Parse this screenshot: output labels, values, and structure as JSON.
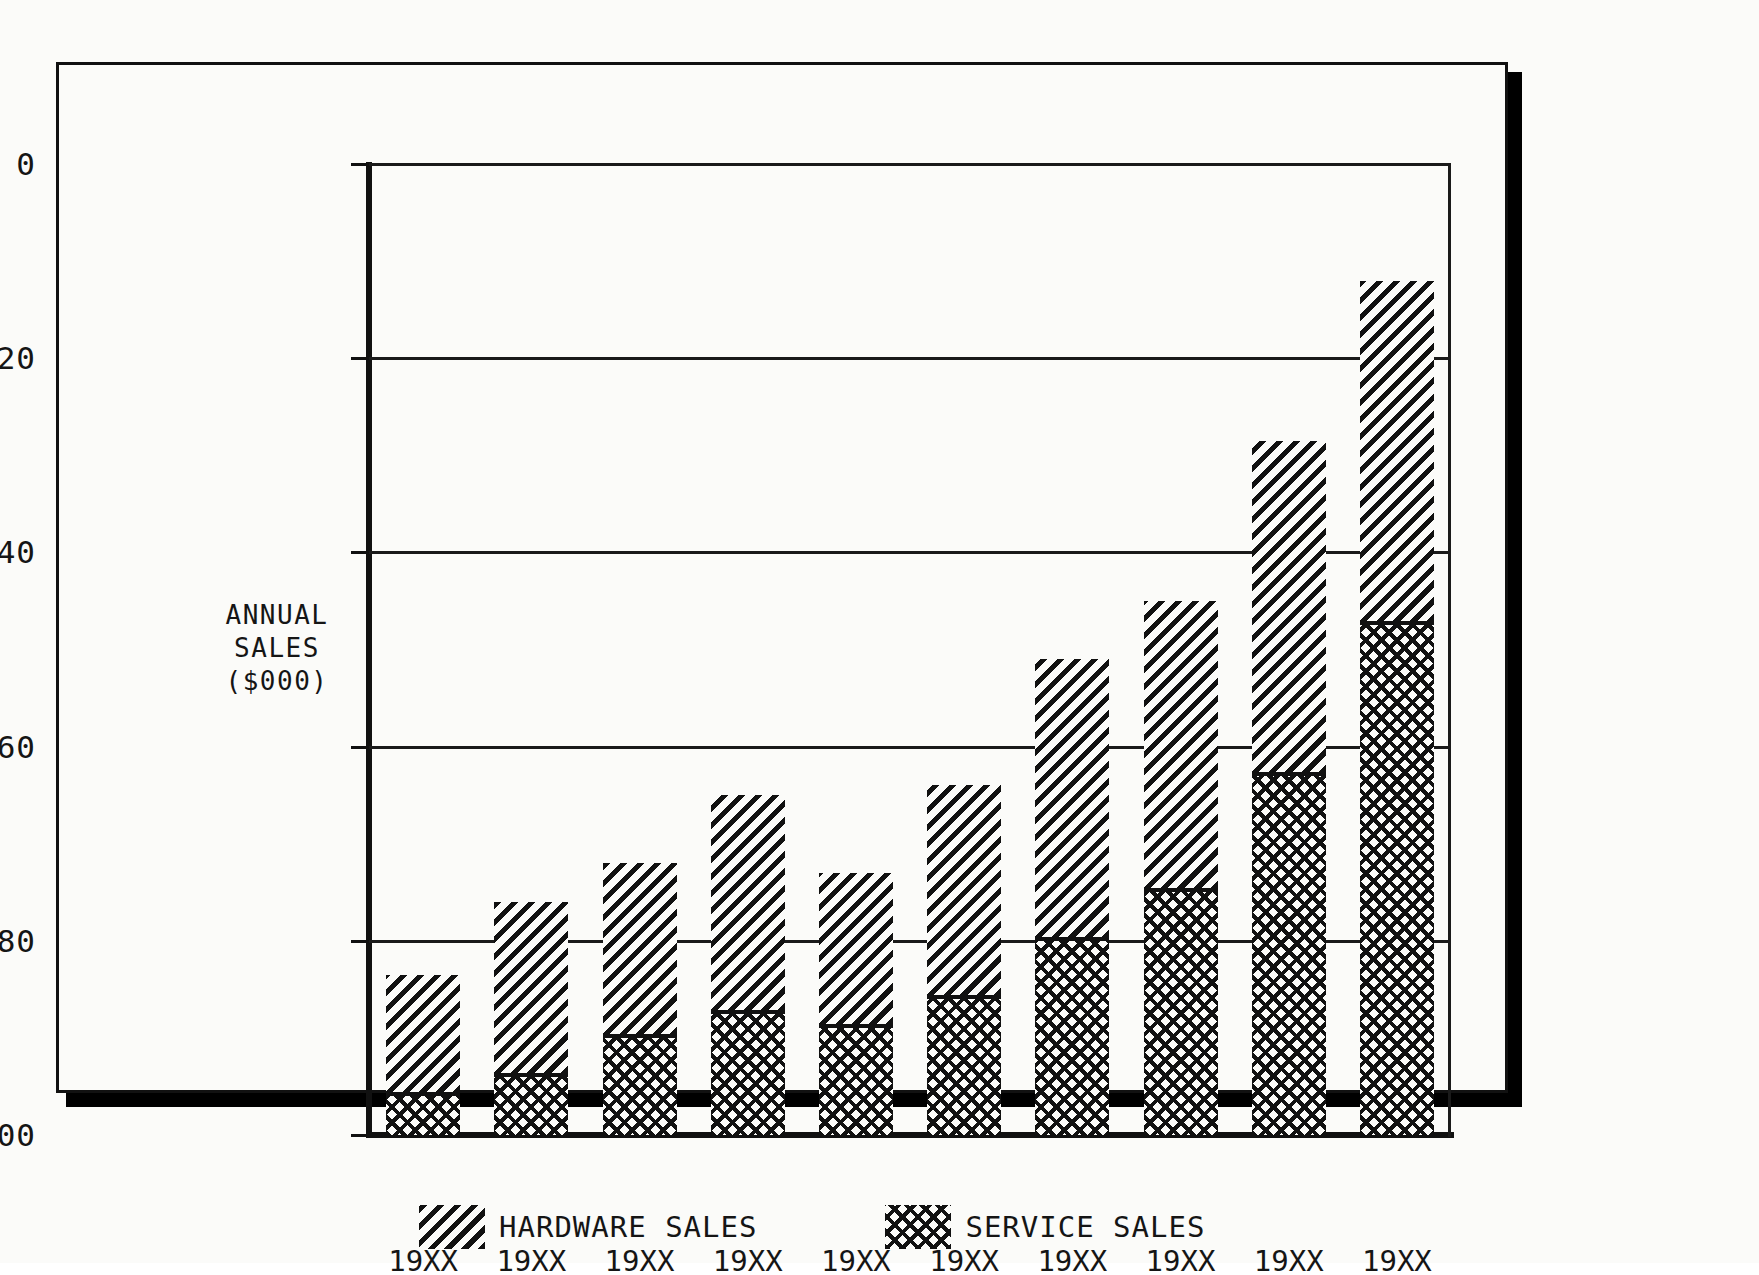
{
  "figure": {
    "caption": ""
  },
  "axes": {
    "y_title_line1": "ANNUAL",
    "y_title_line2": "SALES",
    "y_title_line3": "($000)",
    "y_ticks": [
      "100",
      "80",
      "60",
      "40",
      "20",
      "0"
    ]
  },
  "legend": {
    "entries": [
      {
        "label": "HARDWARE SALES",
        "pattern": "diagonal-hatch"
      },
      {
        "label": "SERVICE SALES",
        "pattern": "cross-hatch"
      }
    ]
  },
  "chart_data": {
    "type": "bar",
    "subtype": "stacked",
    "title": "",
    "xlabel": "",
    "ylabel": "ANNUAL SALES ($000)",
    "ylim": [
      0,
      100
    ],
    "ytick_values": [
      0,
      20,
      40,
      60,
      80,
      100
    ],
    "grid": "horizontal",
    "legend_position": "bottom",
    "categories": [
      "19XX",
      "19XX",
      "19XX",
      "19XX",
      "19XX",
      "19XX",
      "19XX",
      "19XX",
      "19XX",
      "19XX"
    ],
    "series": [
      {
        "name": "SERVICE SALES",
        "pattern": "cross-hatch",
        "values": [
          4,
          6,
          10,
          12.5,
          11,
          14,
          20,
          25,
          37,
          52.5
        ]
      },
      {
        "name": "HARDWARE SALES",
        "pattern": "diagonal-hatch",
        "values": [
          12.5,
          18,
          18,
          22.5,
          16,
          22,
          29,
          30,
          34.5,
          35.5
        ]
      }
    ],
    "totals": [
      16.5,
      24,
      28,
      35,
      27,
      36,
      49,
      55,
      71.5,
      88
    ]
  },
  "colors": {
    "ink": "#111111",
    "paper": "#fbfbf9"
  }
}
